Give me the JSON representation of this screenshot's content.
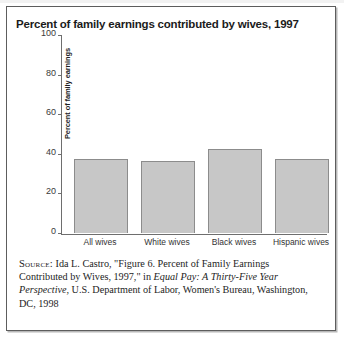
{
  "figure": {
    "title": "Percent of family earnings contributed by wives, 1997",
    "border_color": "#5d5d5d",
    "background": "#ffffff"
  },
  "chart_data": {
    "type": "bar",
    "title": "Percent of family earnings contributed by wives, 1997",
    "xlabel": "",
    "ylabel": "Percent of family earnings",
    "categories": [
      "All wives",
      "White wives",
      "Black wives",
      "Hispanic wives"
    ],
    "values": [
      37.5,
      36.5,
      42.5,
      37.5
    ],
    "ylim": [
      0,
      100
    ],
    "yticks": [
      0,
      20,
      40,
      60,
      80,
      100
    ],
    "ytick_labels": [
      "0",
      "20",
      "40",
      "60",
      "80",
      "100"
    ],
    "grid": false,
    "legend": null,
    "bar_fill": "#c7c7c7",
    "bar_edge": "#8c8c8c",
    "axis_color": "#6e6e6e"
  },
  "source": {
    "label": "Source:",
    "text_before_italic": " Ida L. Castro, \"Figure 6. Percent of Family Earnings Contributed by Wives, 1997,\" in ",
    "italic_title": "Equal Pay: A Thirty-Five Year Perspective",
    "text_after_italic": ", U.S. Department of Labor, Women's Bureau, Washington, DC, 1998"
  }
}
